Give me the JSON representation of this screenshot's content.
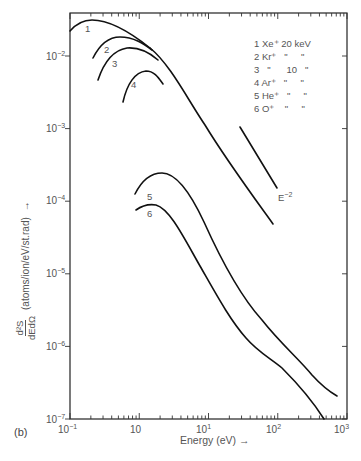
{
  "chart_data": {
    "type": "line",
    "panel": "(b)",
    "xlabel": "Energy (eV)",
    "ylabel": "d²S/dE dΩ (atoms/ion/eV/st.rad)",
    "xscale": "log",
    "yscale": "log",
    "xlim": [
      0.1,
      1000
    ],
    "ylim": [
      1e-07,
      0.04
    ],
    "x_tick_labels": [
      "10⁻¹",
      "10",
      "10¹",
      "10²",
      "10³"
    ],
    "y_tick_labels": [
      "10⁻²",
      "10⁻³",
      "10⁻⁴",
      "10⁻⁵",
      "10⁻⁶",
      "10⁻⁷"
    ],
    "legend": [
      {
        "id": "1",
        "ion": "Xe⁺",
        "energy": "20 keV"
      },
      {
        "id": "2",
        "ion": "Kr⁺",
        "energy": "20 keV (\")"
      },
      {
        "id": "3",
        "ion": "Kr⁺ (\")",
        "energy": "10 keV"
      },
      {
        "id": "4",
        "ion": "Ar⁺",
        "energy": "10 keV (\")"
      },
      {
        "id": "5",
        "ion": "He⁺",
        "energy": "10 keV (\")"
      },
      {
        "id": "6",
        "ion": "O⁺",
        "energy": "10 keV (\")"
      }
    ],
    "legend_text": [
      "1 Xe⁺ 20 keV",
      "2 Kr⁺   \"    \"",
      "3   \"     10   \"",
      "4 Ar⁺   \"    \"",
      "5 He⁺   \"    \"",
      "6 O⁺    \"    \""
    ],
    "annotations": [
      {
        "text": "E⁻²",
        "note": "reference slope line"
      }
    ],
    "series": [
      {
        "name": "1 Xe+ 20 keV",
        "x": [
          0.1,
          0.15,
          0.2,
          0.3,
          0.5,
          1,
          2,
          4
        ],
        "y": [
          0.024,
          0.029,
          0.03,
          0.028,
          0.022,
          0.014,
          0.0075,
          0.0035
        ]
      },
      {
        "name": "2 Kr+ 20 keV",
        "x": [
          0.33,
          0.5,
          0.75,
          1,
          2,
          4
        ],
        "y": [
          0.01,
          0.015,
          0.017,
          0.016,
          0.01,
          0.0035
        ]
      },
      {
        "name": "3 Kr+ 10 keV",
        "x": [
          0.4,
          0.6,
          0.9,
          1.2,
          2,
          4
        ],
        "y": [
          0.0064,
          0.0098,
          0.0118,
          0.012,
          0.0094,
          0.0035
        ]
      },
      {
        "name": "4 Ar+ 10 keV",
        "x": [
          0.75,
          1,
          1.3,
          2,
          3,
          4
        ],
        "y": [
          0.0032,
          0.0056,
          0.0075,
          0.0086,
          0.0062,
          0.0035
        ]
      },
      {
        "name": "envelope 1-4",
        "x": [
          4,
          10,
          30,
          100
        ],
        "y": [
          0.0035,
          0.0013,
          0.00042,
          5e-05
        ]
      },
      {
        "name": "5 He+ 10 keV",
        "x": [
          1.2,
          2,
          2.6,
          4,
          10,
          40,
          80,
          300,
          900
        ],
        "y": [
          0.00013,
          0.0002,
          0.00023,
          0.0002,
          6.4e-05,
          5.4e-06,
          1.7e-06,
          5e-07,
          1.4e-07
        ]
      },
      {
        "name": "6 O+ 10 keV",
        "x": [
          1.25,
          1.6,
          2,
          4,
          8,
          30,
          70,
          130,
          350,
          600
        ],
        "y": [
          8.5e-05,
          9e-05,
          8.5e-05,
          5.3e-05,
          1.6e-05,
          1.8e-06,
          7.2e-07,
          3.7e-07,
          1.3e-07,
          1e-07
        ]
      },
      {
        "name": "E⁻² reference",
        "x": [
          30,
          100
        ],
        "y": [
          0.0011,
          0.00012
        ]
      }
    ]
  },
  "labels": {
    "panel": "(b)",
    "xlabel": "Energy (eV)",
    "ylabel_num": "d²S",
    "ylabel_den": "dEdΩ",
    "ylabel_units": "(atoms/ion/eV/st.rad)",
    "arrow": "→",
    "e_minus_2": "E",
    "e_minus_2_exp": "−2",
    "curve_ids": [
      "1",
      "2",
      "3",
      "4",
      "5",
      "6"
    ],
    "legend_lines": [
      "1 Xe⁺ 20 keV",
      "2 Kr⁺   \"     \"",
      "3   \"      10   \"",
      "4 Ar⁺   \"     \"",
      "5 He⁺   \"     \"",
      "6 O⁺    \"     \""
    ],
    "x_ticks": [
      "10",
      "10",
      "10",
      "10",
      "10"
    ],
    "x_exps": [
      "−1",
      "",
      "1",
      "2",
      "3"
    ],
    "y_ticks": [
      "10",
      "10",
      "10",
      "10",
      "10",
      "10"
    ],
    "y_exps": [
      "−2",
      "−3",
      "−4",
      "−5",
      "−6",
      "−7"
    ]
  }
}
